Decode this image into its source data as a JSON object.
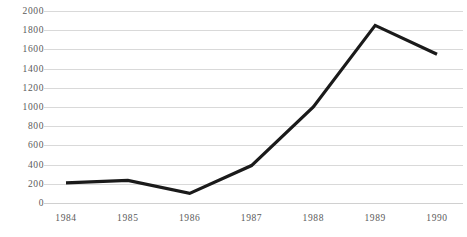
{
  "chart_data": {
    "type": "line",
    "title": "",
    "subtitle": "",
    "xlabel": "",
    "ylabel": "",
    "categories": [
      "1984",
      "1985",
      "1986",
      "1987",
      "1988",
      "1989",
      "1990"
    ],
    "values": [
      210,
      235,
      100,
      390,
      1000,
      1850,
      1550
    ],
    "series": [
      {
        "name": "",
        "values": [
          210,
          235,
          100,
          390,
          1000,
          1850,
          1550
        ]
      }
    ],
    "ylim": [
      0,
      2000
    ],
    "ytick_values": [
      0,
      200,
      400,
      600,
      800,
      1000,
      1200,
      1400,
      1600,
      1800,
      2000
    ],
    "ytick_labels": [
      "0",
      "200",
      "400",
      "600",
      "800",
      "1000",
      "1200",
      "1400",
      "1600",
      "1800",
      "2000"
    ],
    "xtick_labels": [
      "1984",
      "1985",
      "1986",
      "1987",
      "1988",
      "1989",
      "1990"
    ],
    "grid": true,
    "grid_axis": "y",
    "legend": false,
    "legend_position": "none",
    "markers": false,
    "line_color": "#1a1a1a",
    "grid_color": "#d9d9d9",
    "tick_label_color": "#5a5a5a",
    "background_color": "#ffffff"
  }
}
